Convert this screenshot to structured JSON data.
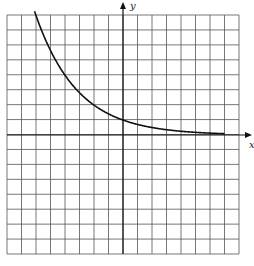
{
  "chart_data": {
    "type": "line",
    "title": "",
    "xlabel": "x",
    "ylabel": "y",
    "xlim": [
      -8,
      8
    ],
    "ylim": [
      -8,
      8
    ],
    "grid": true,
    "grid_step": 1,
    "tick_labels": false,
    "function": "y = 2^(-x/2)",
    "series": [
      {
        "name": "exponential decay curve",
        "x": [
          -6,
          -5,
          -4,
          -3,
          -2,
          -1,
          0,
          1,
          2,
          3,
          4,
          5,
          6,
          7
        ],
        "y": [
          8,
          5.66,
          4,
          2.83,
          2,
          1.41,
          1,
          0.71,
          0.5,
          0.35,
          0.25,
          0.18,
          0.13,
          0.09
        ]
      }
    ]
  },
  "labels": {
    "x_axis": "x",
    "y_axis": "y"
  },
  "colors": {
    "grid": "#555555",
    "curve": "#111111",
    "axis": "#111111"
  }
}
